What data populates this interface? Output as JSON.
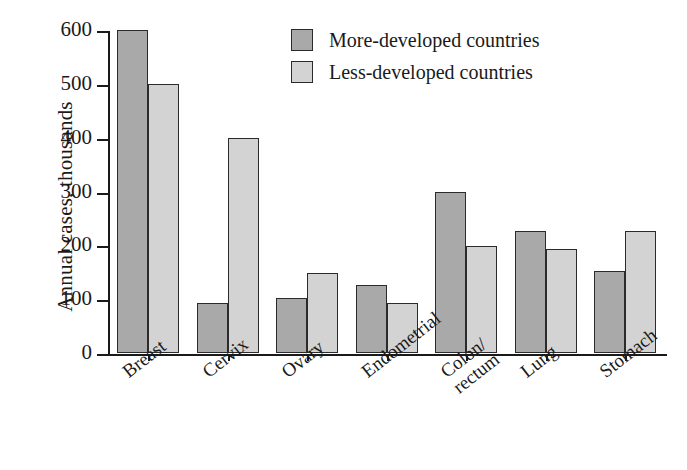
{
  "chart_data": {
    "type": "bar",
    "title": "",
    "xlabel": "",
    "ylabel": "Annual cases, thousands",
    "ylim": [
      0,
      600
    ],
    "yticks": [
      0,
      100,
      200,
      300,
      400,
      500,
      600
    ],
    "grid": false,
    "legend_position": "top-center",
    "categories": [
      "Breast",
      "Cervix",
      "Ovary",
      "Endometrial",
      "Colon/\nrectum",
      "Lung",
      "Stomach"
    ],
    "series": [
      {
        "name": "More-developed countries",
        "color": "#a9a9a9",
        "values": [
          600,
          93,
          102,
          126,
          300,
          226,
          152
        ]
      },
      {
        "name": "Less-developed countries",
        "color": "#d3d3d3",
        "values": [
          500,
          400,
          148,
          92,
          198,
          194,
          226
        ]
      }
    ]
  },
  "legend": {
    "items": [
      {
        "label": "More-developed countries",
        "swatch": "#a9a9a9"
      },
      {
        "label": "Less-developed countries",
        "swatch": "#d3d3d3"
      }
    ]
  },
  "axis": {
    "y_title": "Annual cases, thousands",
    "y_tick_labels": [
      "600",
      "500",
      "400",
      "300",
      "200",
      "100",
      "0"
    ],
    "x_tick_labels": [
      "Breast",
      "Cervix",
      "Ovary",
      "Endometrial",
      "Colon/\nrectum",
      "Lung",
      "Stomach"
    ]
  }
}
